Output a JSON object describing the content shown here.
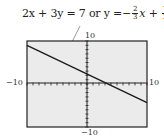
{
  "chart_data": {
    "type": "line",
    "equation": {
      "standard_form": "2x + 3y = 7",
      "connector": "or",
      "lhs": "y =",
      "sign": "−",
      "coef_num": "2",
      "coef_den": "3",
      "var": "x",
      "plus": "+",
      "const_num": "7",
      "const_den": "3"
    },
    "xlim": [
      -10,
      10
    ],
    "ylim": [
      -10,
      10
    ],
    "tick_labels": {
      "x_min": "−10",
      "x_max": "10",
      "y_min": "−10",
      "y_max": "10"
    },
    "grid": false,
    "series": [
      {
        "name": "y = -2/3 x + 7/3",
        "x": [
          -10,
          10
        ],
        "y": [
          9,
          -4.33
        ]
      }
    ],
    "colors": {
      "background": "#ebebeb",
      "frame": "#222222",
      "line": "#1a1a1a"
    }
  }
}
